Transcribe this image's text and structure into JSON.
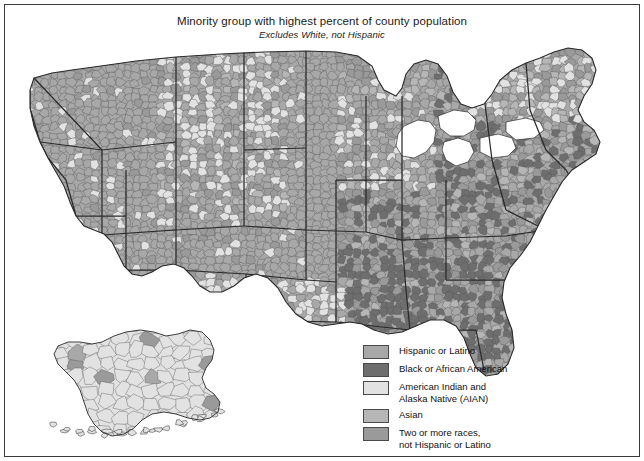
{
  "title": {
    "main": "Minority group with highest percent of county population",
    "subtitle": "Excludes White, not Hispanic"
  },
  "legend": {
    "items": [
      {
        "label": "Hispanic or Latino",
        "color": "#a8a8a8"
      },
      {
        "label": "Black or African American",
        "color": "#6e6e6e"
      },
      {
        "label": "American Indian and\nAlaska Native (AIAN)",
        "color": "#e2e2e2"
      },
      {
        "label": "Asian",
        "color": "#b6b6b6"
      },
      {
        "label": "Two or more races,\nnot Hispanic or Latino",
        "color": "#9a9a9a"
      }
    ]
  },
  "map": {
    "type": "choropleth",
    "geography": "United States counties",
    "insets": [
      "Alaska"
    ],
    "water_color": "#ffffff",
    "boundary_color": "#2b2b2b",
    "county_line_color": "#555555",
    "regions": [
      {
        "name": "Pacific Northwest",
        "category": "Hispanic or Latino"
      },
      {
        "name": "California",
        "category": "Hispanic or Latino"
      },
      {
        "name": "Southwest",
        "category": "Hispanic or Latino"
      },
      {
        "name": "Texas",
        "category": "Hispanic or Latino"
      },
      {
        "name": "Great Plains",
        "category": "American Indian and Alaska Native (AIAN)"
      },
      {
        "name": "Oklahoma",
        "category": "American Indian and Alaska Native (AIAN)"
      },
      {
        "name": "Upper Midwest",
        "category": "Two or more races, not Hispanic or Latino"
      },
      {
        "name": "Southeast",
        "category": "Black or African American"
      },
      {
        "name": "Northeast",
        "category": "Two or more races, not Hispanic or Latino"
      },
      {
        "name": "Maine",
        "category": "American Indian and Alaska Native (AIAN)"
      },
      {
        "name": "Alaska",
        "category": "American Indian and Alaska Native (AIAN)"
      },
      {
        "name": "Florida",
        "category": "Black or African American"
      }
    ]
  }
}
